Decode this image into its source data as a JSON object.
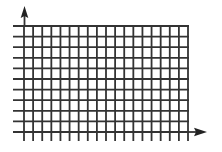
{
  "diagram": {
    "type": "coordinate-grid",
    "line_color": "#333333",
    "background_color": "#ffffff",
    "grid": {
      "vertical_lines": 19,
      "horizontal_lines": 11,
      "x_start": 24,
      "x_end": 188,
      "y_start": 26,
      "y_end": 132,
      "h_line_left": 13,
      "h_line_right": 189,
      "v_line_bottom": 141
    },
    "y_axis": {
      "x": 24.5,
      "top": 6,
      "arrow": "up-arrow"
    },
    "x_axis": {
      "y": 132,
      "right": 207,
      "arrow": "right-arrow"
    }
  }
}
